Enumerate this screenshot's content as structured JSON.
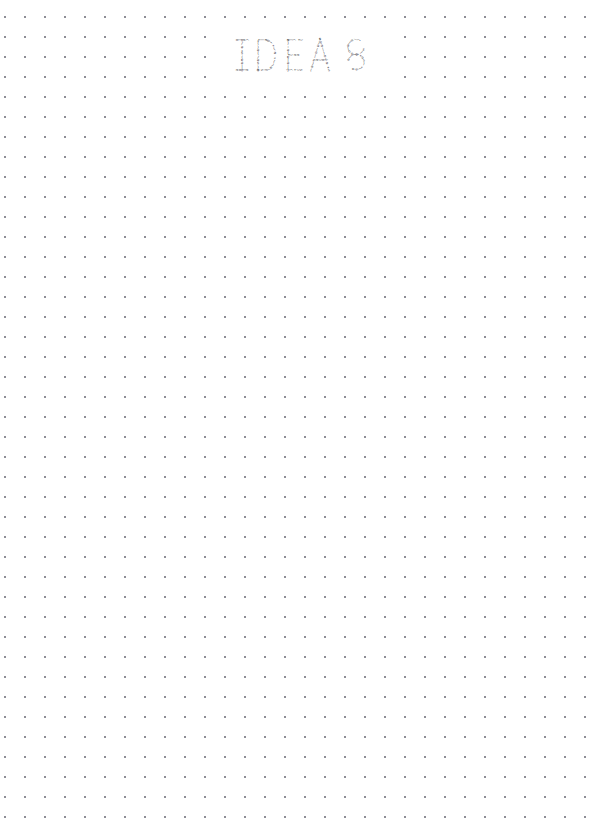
{
  "page": {
    "width": 592,
    "height": 818,
    "background_color": "#ffffff",
    "kind": "dot-grid-notebook-page"
  },
  "grid": {
    "name": "dot-grid",
    "dot_color": "#8e8e96",
    "dot_radius_px": 1,
    "spacing_x_px": 20,
    "spacing_y_px": 20,
    "origin_x_px": 15,
    "origin_y_px": 27,
    "columns": 29,
    "rows": 39
  },
  "wordart": {
    "name": "ideas-wordart",
    "text": "IDEAS",
    "style": "typographic-letters-built-from-tiny-punctuation-glyphs",
    "glyph_color": "#3a3a42",
    "bounds": {
      "x": 224,
      "y": 34,
      "width": 160,
      "height": 56
    },
    "letters": [
      {
        "char": "I",
        "x": 234,
        "glyph_runs": [
          "o",
          "|",
          "e",
          "(",
          "o",
          "/",
          "e",
          "*",
          "s",
          ")",
          "a",
          "e",
          "|",
          "o",
          "e"
        ]
      },
      {
        "char": "D",
        "x": 256,
        "glyph_runs": [
          "*",
          ")",
          "(",
          "e",
          ")",
          "/",
          "e",
          "s",
          "(",
          "o",
          "*",
          "|",
          "e",
          "/",
          "a",
          "(",
          "*",
          ")",
          "e"
        ]
      },
      {
        "char": "E",
        "x": 285,
        "glyph_runs": [
          "e",
          "|",
          "(",
          "*",
          ")",
          "s",
          "(",
          ":",
          "e",
          ")",
          "a",
          "|",
          "e",
          "|",
          "(",
          "*",
          ")",
          "e"
        ]
      },
      {
        "char": "A",
        "x": 310,
        "glyph_runs": [
          "s",
          "(",
          "e",
          ")",
          "o",
          "|",
          "*",
          "(",
          "e",
          ")",
          "s",
          "a",
          "e",
          "|",
          "(",
          "o",
          ")",
          "e",
          "*"
        ]
      },
      {
        "char": "S",
        "x": 346,
        "glyph_runs": [
          "s",
          "(",
          "*",
          ")",
          "e",
          "o",
          "|",
          "a",
          ")",
          "e",
          "/",
          "(",
          "a",
          ")",
          "|",
          "o",
          "*",
          "e"
        ]
      }
    ]
  }
}
